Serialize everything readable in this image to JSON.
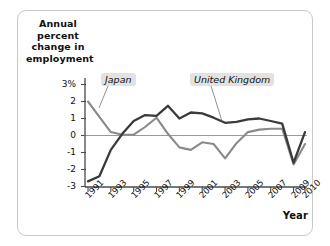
{
  "chart_data": {
    "type": "line",
    "title": "",
    "subtitle": "",
    "ylabel": "Annual percent change in employment",
    "xlabel": "Year",
    "ylim": [
      -3,
      3
    ],
    "xlim": [
      1991,
      2010
    ],
    "grid": false,
    "zero_line": true,
    "legend_position": "inline-annotations",
    "ytick_labels": [
      "3%",
      "2",
      "1",
      "0",
      "-1",
      "-2",
      "-3"
    ],
    "ytick_values": [
      3,
      2,
      1,
      0,
      -1,
      -2,
      -3
    ],
    "xtick_labels": [
      "1991",
      "1993",
      "1995",
      "1997",
      "1999",
      "2001",
      "2003",
      "2005",
      "2007",
      "2009",
      "2010"
    ],
    "xtick_values": [
      1991,
      1993,
      1995,
      1997,
      1999,
      2001,
      2003,
      2005,
      2007,
      2009,
      2010
    ],
    "x": [
      1991,
      1992,
      1993,
      1994,
      1995,
      1996,
      1997,
      1998,
      1999,
      2000,
      2001,
      2002,
      2003,
      2004,
      2005,
      2006,
      2007,
      2008,
      2009,
      2010
    ],
    "series": [
      {
        "name": "United Kingdom",
        "color": "#3a3a3a",
        "values": [
          -2.7,
          -2.4,
          -0.85,
          0.1,
          0.85,
          1.2,
          1.15,
          1.75,
          1.0,
          1.35,
          1.3,
          1.05,
          0.75,
          0.8,
          0.95,
          1.0,
          0.85,
          0.7,
          -1.6,
          0.2
        ]
      },
      {
        "name": "Japan",
        "color": "#8a8a8a",
        "values": [
          2.0,
          1.1,
          0.2,
          0.05,
          0.05,
          0.5,
          1.05,
          0.1,
          -0.7,
          -0.85,
          -0.4,
          -0.5,
          -1.35,
          -0.45,
          0.2,
          0.35,
          0.4,
          0.4,
          -1.7,
          -0.5
        ]
      }
    ],
    "annotations": [
      {
        "text": "Japan",
        "series": "Japan",
        "style": "italic-boxed"
      },
      {
        "text": "United Kingdom",
        "series": "United Kingdom",
        "style": "italic-boxed"
      }
    ]
  },
  "axis": {
    "y_title": "Annual percent change in employment",
    "x_title": "Year"
  },
  "colors": {
    "uk_line": "#3a3a3a",
    "japan_line": "#8a8a8a",
    "axis": "#4a4a4a",
    "zero_line": "#9a9a9a",
    "label_bg": "#e2e2e2",
    "card_border": "#c9c9c9"
  }
}
